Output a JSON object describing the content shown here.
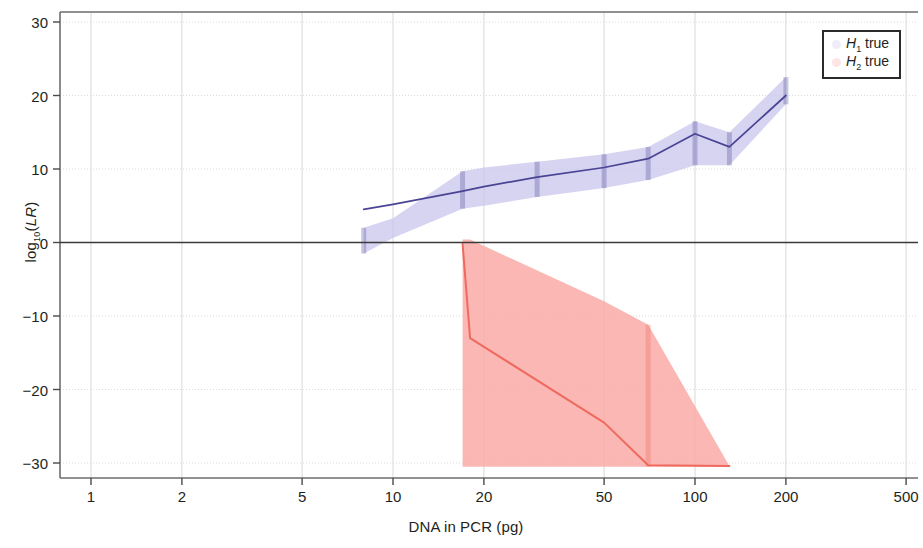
{
  "chart_data": {
    "type": "area",
    "title": "",
    "xlabel": "DNA in PCR (pg)",
    "ylabel": "log10(LR)",
    "ylabel_parts": {
      "prefix": "log",
      "sub": "10",
      "paren_open": "(",
      "italic": "LR",
      "paren_close": ")"
    },
    "xscale": "log",
    "xlim": [
      0.8,
      620
    ],
    "ylim": [
      -32.5,
      32.5
    ],
    "xticks": [
      1,
      2,
      5,
      10,
      20,
      50,
      100,
      200,
      500
    ],
    "xticklabels": [
      "1",
      "2",
      "5",
      "10",
      "20",
      "50",
      "100",
      "200",
      "500"
    ],
    "yticks": [
      30,
      20,
      10,
      0,
      -10,
      -20,
      -30
    ],
    "yticklabels": [
      "30",
      "20",
      "10",
      "0",
      "−10",
      "−20",
      "−30"
    ],
    "grid": true,
    "zero_line": true,
    "legend_position": "top-right",
    "legend": [
      {
        "label_prefix": "H",
        "label_sub": "1",
        "label_suffix": " true",
        "color": "#6b63c8",
        "fill": "#c8c4ea"
      },
      {
        "label_prefix": "H",
        "label_sub": "2",
        "label_suffix": " true",
        "color": "#ef6a5e",
        "fill": "#f9aaa6"
      }
    ],
    "series": [
      {
        "name": "H1 true",
        "color": "#4a4494",
        "fill": "#c9c5ec",
        "fill_opacity": 0.75,
        "x": [
          8,
          10,
          17,
          20,
          30,
          50,
          70,
          100,
          130,
          200
        ],
        "median": [
          4.5,
          5.2,
          7.0,
          7.6,
          8.9,
          10.2,
          11.4,
          14.8,
          13.0,
          20.0
        ],
        "upper": [
          2.0,
          3.3,
          9.7,
          10.2,
          11.0,
          12.0,
          13.0,
          16.5,
          15.0,
          22.5
        ],
        "lower": [
          -1.5,
          0.6,
          4.6,
          5.0,
          6.2,
          7.4,
          8.5,
          10.5,
          10.5,
          18.8
        ],
        "markers_x": [
          8,
          17,
          30,
          50,
          70,
          100,
          130,
          200
        ]
      },
      {
        "name": "H2 true",
        "color": "#ef6a5e",
        "fill": "#f9aaa6",
        "fill_opacity": 0.85,
        "x": [
          17,
          18,
          50,
          70,
          130
        ],
        "median": [
          -0.2,
          -13.0,
          -24.5,
          -30.3,
          -30.4
        ],
        "upper": [
          0.4,
          0.4,
          -8.0,
          -11.2,
          -30.4
        ],
        "lower": [
          -30.5,
          -30.5,
          -30.5,
          -30.5,
          -30.5
        ],
        "markers_x": [
          70
        ]
      }
    ]
  },
  "axes": {
    "xlabel": "DNA in PCR (pg)",
    "xticklabels": [
      "1",
      "2",
      "5",
      "10",
      "20",
      "50",
      "100",
      "200",
      "500"
    ],
    "yticklabels": [
      "30",
      "20",
      "10",
      "0",
      "−10",
      "−20",
      "−30"
    ]
  },
  "legend": {
    "items": [
      {
        "prefix": "H",
        "sub": "1",
        "suffix": " true"
      },
      {
        "prefix": "H",
        "sub": "2",
        "suffix": " true"
      }
    ]
  }
}
